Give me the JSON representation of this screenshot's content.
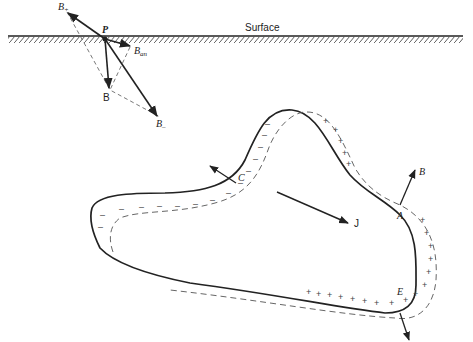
{
  "figure": {
    "surface_label": "Surface",
    "surface_diagram": {
      "point_label": "P",
      "b_plus_label": "B",
      "b_plus_sub": "+",
      "b_an_label": "B",
      "b_an_sub": "an",
      "b_label": "B",
      "b_minus_label": "B",
      "b_minus_sub": "–"
    },
    "conductor": {
      "point_c": "C",
      "point_a": "A",
      "point_e": "E",
      "current_label": "J",
      "field_label": "B",
      "negative_charge_symbol": "–",
      "positive_charge_symbol": "+"
    },
    "colors": {
      "line": "#222222",
      "dashed": "#555555",
      "background": "#ffffff"
    }
  }
}
